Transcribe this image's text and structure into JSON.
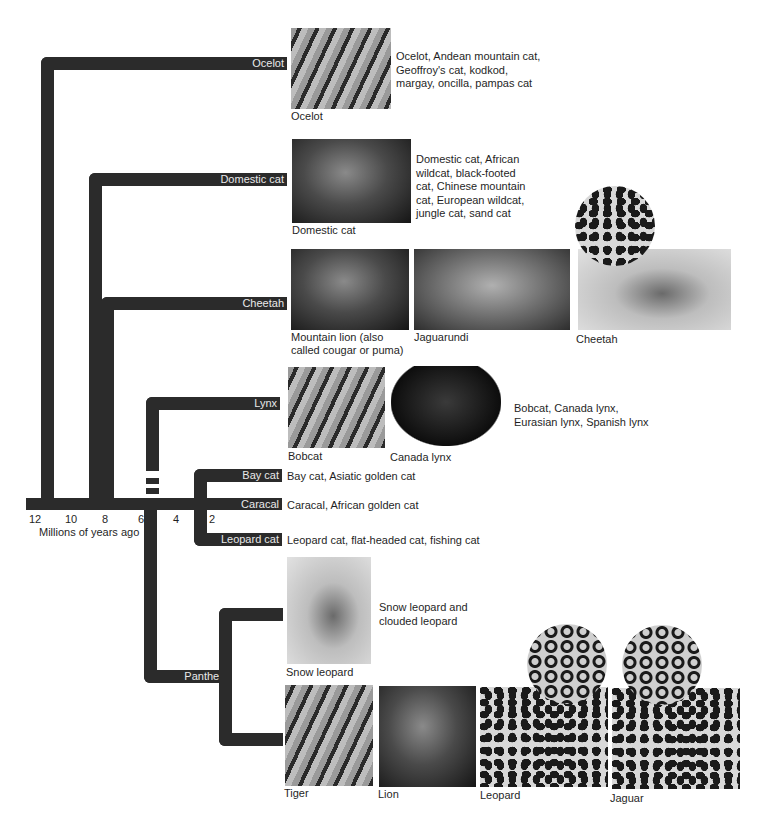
{
  "figure": {
    "axis": {
      "label": "Millions of years ago",
      "ticks": [
        "12",
        "10",
        "8",
        "6",
        "4",
        "2"
      ]
    },
    "lineages": [
      {
        "id": "ocelot",
        "label": "Ocelot",
        "members": "Ocelot, Andean mountain cat, Geoffroy's cat, kodkod, margay, oncilla, pampas cat",
        "photos": [
          {
            "caption": "Ocelot"
          }
        ]
      },
      {
        "id": "domestic",
        "label": "Domestic cat",
        "members": "Domestic cat, African wildcat, black-footed cat, Chinese mountain cat, European wildcat, jungle cat, sand cat",
        "photos": [
          {
            "caption": "Domestic cat"
          }
        ]
      },
      {
        "id": "cheetah",
        "label": "Cheetah",
        "members": "",
        "photos": [
          {
            "caption": "Mountain lion (also called cougar or puma)"
          },
          {
            "caption": "Jaguarundi"
          },
          {
            "caption": "Cheetah"
          }
        ]
      },
      {
        "id": "lynx",
        "label": "Lynx",
        "members": "Bobcat, Canada lynx, Eurasian lynx, Spanish lynx",
        "photos": [
          {
            "caption": "Bobcat"
          },
          {
            "caption": "Canada lynx"
          }
        ]
      },
      {
        "id": "baycat",
        "label": "Bay cat",
        "members": "Bay cat, Asiatic golden cat",
        "photos": []
      },
      {
        "id": "caracal",
        "label": "Caracal",
        "members": "Caracal, African golden cat",
        "photos": []
      },
      {
        "id": "leopardcat",
        "label": "Leopard cat",
        "members": "Leopard cat, flat-headed cat, fishing cat",
        "photos": []
      },
      {
        "id": "panthera",
        "label": "Panthera",
        "members": "Snow leopard and clouded leopard",
        "photos": [
          {
            "caption": "Snow leopard"
          },
          {
            "caption": "Tiger"
          },
          {
            "caption": "Lion"
          },
          {
            "caption": "Leopard"
          },
          {
            "caption": "Jaguar"
          }
        ]
      }
    ],
    "colors": {
      "branch": "#2b2b2b",
      "branch_label": "#e9e9e9",
      "background": "#ffffff"
    }
  }
}
